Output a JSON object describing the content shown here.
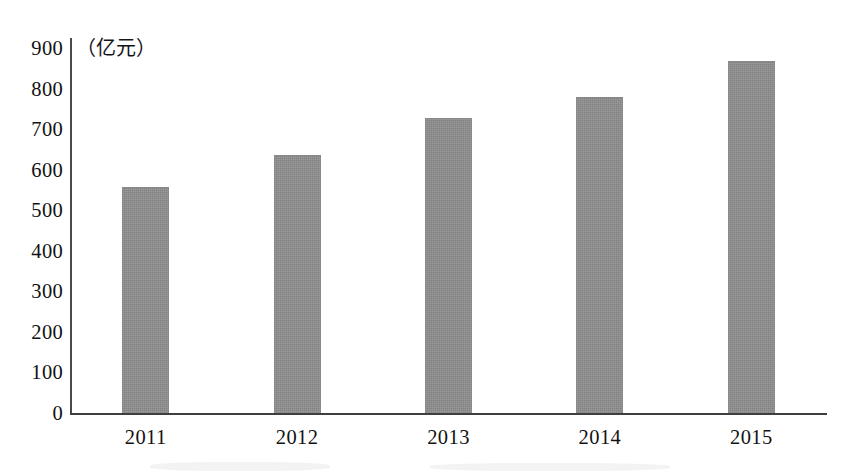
{
  "chart_data": {
    "type": "bar",
    "title": "",
    "subtitle": "",
    "xlabel": "",
    "ylabel": "",
    "unit_label": "（亿元）",
    "categories": [
      "2011",
      "2012",
      "2013",
      "2014",
      "2015"
    ],
    "values": [
      557,
      636,
      727,
      779,
      868
    ],
    "series": [
      {
        "name": "",
        "values": [
          557,
          636,
          727,
          779,
          868
        ]
      }
    ],
    "ylim": [
      0,
      900
    ],
    "y_ticks": [
      "900",
      "800",
      "700",
      "600",
      "500",
      "400",
      "300",
      "200",
      "100",
      "0"
    ],
    "y_tick_values": [
      900,
      800,
      700,
      600,
      500,
      400,
      300,
      200,
      100,
      0
    ],
    "grid": false,
    "legend": false,
    "legend_position": "none",
    "bar_color": "#8e8e8e",
    "axis_color": "#3f3f3f",
    "background_color": "#ffffff"
  }
}
